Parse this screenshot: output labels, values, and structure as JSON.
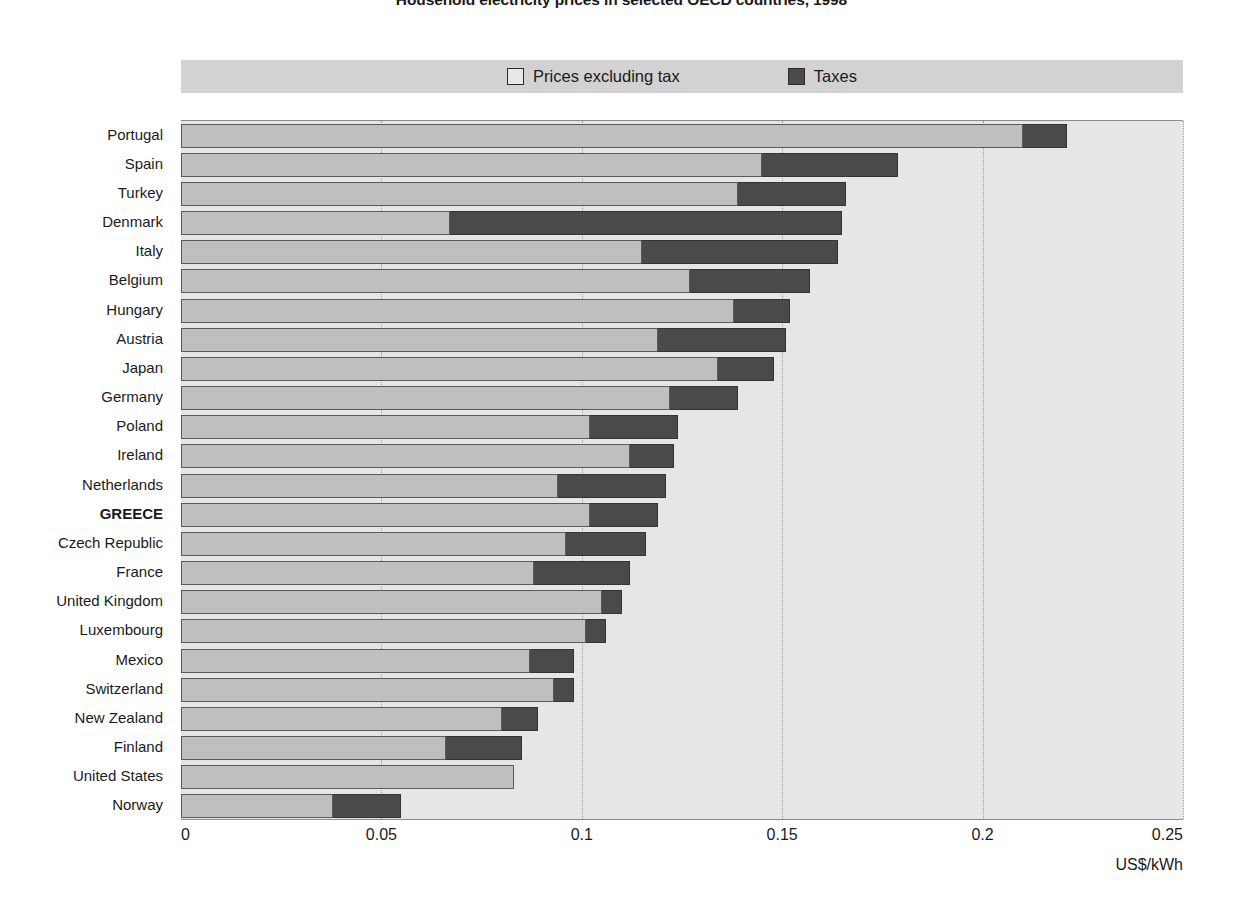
{
  "chart_data": {
    "type": "bar",
    "orientation": "horizontal",
    "stacked": true,
    "title": "Household electricity prices in selected OECD countries, 1998",
    "xlabel": "US$/kWh",
    "ylabel": "",
    "xlim": [
      0,
      0.25
    ],
    "xticks": [
      "0",
      "0.05",
      "0.1",
      "0.15",
      "0.2",
      "0.25"
    ],
    "xtick_values": [
      0,
      0.05,
      0.1,
      0.15,
      0.2,
      0.25
    ],
    "grid": "vertical-dotted",
    "legend_position": "top",
    "highlight_category": "GREECE",
    "categories": [
      "Portugal",
      "Spain",
      "Turkey",
      "Denmark",
      "Italy",
      "Belgium",
      "Hungary",
      "Austria",
      "Japan",
      "Germany",
      "Poland",
      "Ireland",
      "Netherlands",
      "GREECE",
      "Czech Republic",
      "France",
      "United Kingdom",
      "Luxembourg",
      "Mexico",
      "Switzerland",
      "New Zealand",
      "Finland",
      "United States",
      "Norway"
    ],
    "series": [
      {
        "name": "Prices excluding tax",
        "color": "#bfbfbf",
        "values": [
          0.21,
          0.145,
          0.139,
          0.067,
          0.115,
          0.127,
          0.138,
          0.119,
          0.134,
          0.122,
          0.102,
          0.112,
          0.094,
          0.102,
          0.096,
          0.088,
          0.105,
          0.101,
          0.087,
          0.093,
          0.08,
          0.066,
          0.083,
          0.038
        ]
      },
      {
        "name": "Taxes",
        "color": "#4a4a4a",
        "values": [
          0.011,
          0.034,
          0.027,
          0.098,
          0.049,
          0.03,
          0.014,
          0.032,
          0.014,
          0.017,
          0.022,
          0.011,
          0.027,
          0.017,
          0.02,
          0.024,
          0.005,
          0.005,
          0.011,
          0.005,
          0.009,
          0.019,
          0.0,
          0.017
        ]
      }
    ],
    "totals": [
      0.221,
      0.179,
      0.166,
      0.165,
      0.164,
      0.157,
      0.152,
      0.151,
      0.148,
      0.139,
      0.124,
      0.123,
      0.121,
      0.119,
      0.116,
      0.112,
      0.11,
      0.106,
      0.098,
      0.098,
      0.089,
      0.085,
      0.083,
      0.055
    ]
  },
  "legend": {
    "items": [
      {
        "label": "Prices excluding tax",
        "swatch": "light"
      },
      {
        "label": "Taxes",
        "swatch": "dark"
      }
    ]
  },
  "colors": {
    "bar_base": "#bfbfbf",
    "bar_tax": "#4a4a4a",
    "plot_background": "#e6e6e6",
    "legend_background": "#d2d2d2",
    "text": "#1a1a1a"
  }
}
